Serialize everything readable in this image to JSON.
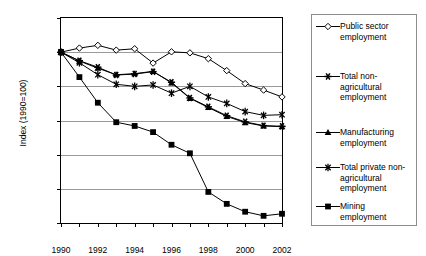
{
  "chart_data": {
    "type": "line",
    "title": "",
    "xlabel": "",
    "ylabel": "Index (1990=100)",
    "xlim": [
      1990,
      2002
    ],
    "ylim": [
      50,
      110
    ],
    "ytick_step": 10,
    "xtick_step": 2,
    "grid": true,
    "legend_position": "right",
    "x": [
      1990,
      1991,
      1992,
      1993,
      1994,
      1995,
      1996,
      1997,
      1998,
      1999,
      2000,
      2001,
      2002
    ],
    "ytick_labels": [
      "50",
      "60",
      "70",
      "80",
      "90",
      "100",
      "110"
    ],
    "xtick_labels": [
      "1990",
      "1992",
      "1994",
      "1996",
      "1998",
      "2000",
      "2002"
    ],
    "series": [
      {
        "name": "Public sector employment",
        "marker": "open-diamond",
        "values": [
          100.0,
          101.2,
          102.0,
          100.6,
          101.0,
          96.8,
          100.1,
          99.8,
          98.1,
          94.6,
          90.8,
          88.9,
          86.9
        ]
      },
      {
        "name": "Total non-agricultural employment",
        "marker": "asterisk",
        "values": [
          100.0,
          97.5,
          95.6,
          93.3,
          93.6,
          94.3,
          91.2,
          86.6,
          84.0,
          81.4,
          79.6,
          78.5,
          78.3
        ]
      },
      {
        "name": "Manufacturing employment",
        "marker": "filled-triangle",
        "values": [
          100.0,
          97.4,
          95.3,
          93.4,
          93.7,
          94.4,
          91.0,
          86.5,
          83.8,
          81.2,
          79.4,
          78.4,
          78.2
        ]
      },
      {
        "name": "Total private non-agricultural employment",
        "marker": "star-x",
        "values": [
          100.0,
          96.9,
          93.4,
          90.6,
          90.0,
          90.4,
          88.0,
          90.0,
          86.9,
          85.0,
          82.6,
          81.5,
          81.7
        ]
      },
      {
        "name": "Mining employment",
        "marker": "filled-square",
        "values": [
          100.0,
          92.7,
          85.2,
          79.5,
          78.4,
          76.6,
          72.9,
          70.4,
          59.1,
          55.6,
          53.3,
          52.1,
          52.7
        ]
      }
    ]
  },
  "legend": {
    "items": [
      {
        "label": "Public sector\nemployment",
        "marker": "open-diamond"
      },
      {
        "label": "Total non-\nagricultural\nemployment",
        "marker": "asterisk"
      },
      {
        "label": "Manufacturing\nemployment",
        "marker": "filled-triangle"
      },
      {
        "label": "Total private non-\nagricultural\nemployment",
        "marker": "star-x"
      },
      {
        "label": "Mining\nemployment",
        "marker": "filled-square"
      }
    ]
  },
  "axis": {
    "y_title": "Index (1990=100)"
  }
}
